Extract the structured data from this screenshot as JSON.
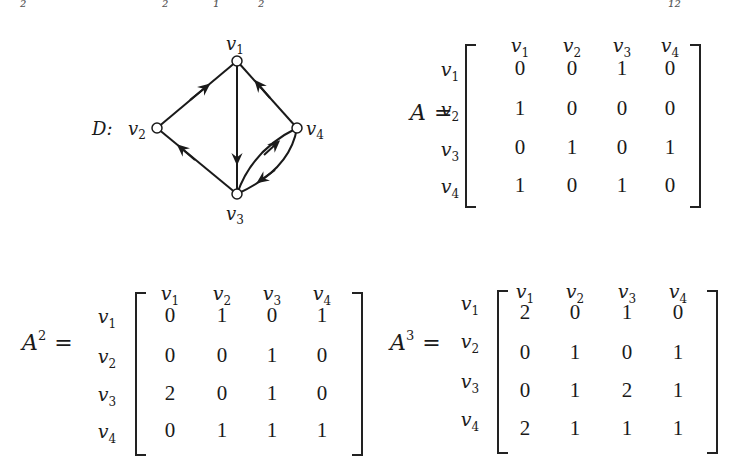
{
  "top_fragments": [
    {
      "text": "₂",
      "x": 20
    },
    {
      "text": "₂",
      "x": 162
    },
    {
      "text": "₁",
      "x": 213
    },
    {
      "text": "₂",
      "x": 258
    },
    {
      "text": "₁₂",
      "x": 668
    }
  ],
  "digraph": {
    "label": "D:",
    "vertices": [
      {
        "id": "v1",
        "label": "v",
        "sub": "1"
      },
      {
        "id": "v2",
        "label": "v",
        "sub": "2"
      },
      {
        "id": "v3",
        "label": "v",
        "sub": "3"
      },
      {
        "id": "v4",
        "label": "v",
        "sub": "4"
      }
    ],
    "arcs": [
      {
        "from": "v2",
        "to": "v1"
      },
      {
        "from": "v1",
        "to": "v3"
      },
      {
        "from": "v4",
        "to": "v1"
      },
      {
        "from": "v3",
        "to": "v2"
      },
      {
        "from": "v3",
        "to": "v4"
      },
      {
        "from": "v4",
        "to": "v3"
      }
    ]
  },
  "matrices": [
    {
      "name": "A",
      "power": "",
      "col_headers": [
        "1",
        "2",
        "3",
        "4"
      ],
      "row_headers": [
        "1",
        "2",
        "3",
        "4"
      ],
      "rows": [
        [
          "0",
          "0",
          "1",
          "0"
        ],
        [
          "1",
          "0",
          "0",
          "0"
        ],
        [
          "0",
          "1",
          "0",
          "1"
        ],
        [
          "1",
          "0",
          "1",
          "0"
        ]
      ]
    },
    {
      "name": "A",
      "power": "2",
      "col_headers": [
        "1",
        "2",
        "3",
        "4"
      ],
      "row_headers": [
        "1",
        "2",
        "3",
        "4"
      ],
      "rows": [
        [
          "0",
          "1",
          "0",
          "1"
        ],
        [
          "0",
          "0",
          "1",
          "0"
        ],
        [
          "2",
          "0",
          "1",
          "0"
        ],
        [
          "0",
          "1",
          "1",
          "1"
        ]
      ]
    },
    {
      "name": "A",
      "power": "3",
      "col_headers": [
        "1",
        "2",
        "3",
        "4"
      ],
      "row_headers": [
        "1",
        "2",
        "3",
        "4"
      ],
      "rows": [
        [
          "2",
          "0",
          "1",
          "0"
        ],
        [
          "0",
          "1",
          "0",
          "1"
        ],
        [
          "0",
          "1",
          "2",
          "1"
        ],
        [
          "2",
          "1",
          "1",
          "1"
        ]
      ]
    }
  ],
  "symbols": {
    "vertex_letter": "v",
    "equals": "="
  }
}
